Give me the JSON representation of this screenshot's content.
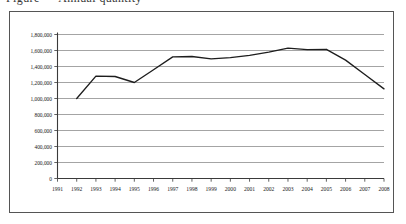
{
  "caption": {
    "text": "Figure — Annual quantity"
  },
  "chart_data": {
    "type": "line",
    "title": "",
    "subtitle": "",
    "xlabel": "",
    "ylabel": "",
    "legend": [],
    "legend_position": "none",
    "grid": true,
    "categories": [
      "1991",
      "1992",
      "1993",
      "1994",
      "1995",
      "1996",
      "1997",
      "1998",
      "1999",
      "2000",
      "2001",
      "2002",
      "2003",
      "2004",
      "2005",
      "2006",
      "2007",
      "2008"
    ],
    "x_tick_labels": [
      "1991",
      "1992",
      "1993",
      "1994",
      "1995",
      "1996",
      "1997",
      "1998",
      "1999",
      "2000",
      "2001",
      "2002",
      "2003",
      "2004",
      "2005",
      "2006",
      "2007",
      "2008"
    ],
    "y_tick_labels": [
      "1,800,000",
      "1,600,000",
      "1,400,000",
      "1,200,000",
      "1,000,000",
      "800,000",
      "600,000",
      "400,000",
      "200,000",
      "0"
    ],
    "y_tick_values": [
      1800000,
      1600000,
      1400000,
      1200000,
      1000000,
      800000,
      600000,
      400000,
      200000,
      0
    ],
    "ylim": [
      0,
      1800000
    ],
    "xlim": [
      "1991",
      "2008"
    ],
    "series": [
      {
        "name": "series-1",
        "x": [
          "1992",
          "1993",
          "1994",
          "1995",
          "1996",
          "1997",
          "1998",
          "1999",
          "2000",
          "2001",
          "2002",
          "2003",
          "2004",
          "2005",
          "2006",
          "2007",
          "2008"
        ],
        "values": [
          1000000,
          1280000,
          1275000,
          1200000,
          1360000,
          1520000,
          1525000,
          1495000,
          1510000,
          1540000,
          1580000,
          1630000,
          1610000,
          1615000,
          1480000,
          1300000,
          1120000
        ]
      }
    ]
  },
  "colors": {
    "line": "#1d1d1d",
    "grid": "#8d8d8d",
    "axis": "#3a3a3a",
    "frame": "#555555",
    "background": "#ffffff"
  }
}
